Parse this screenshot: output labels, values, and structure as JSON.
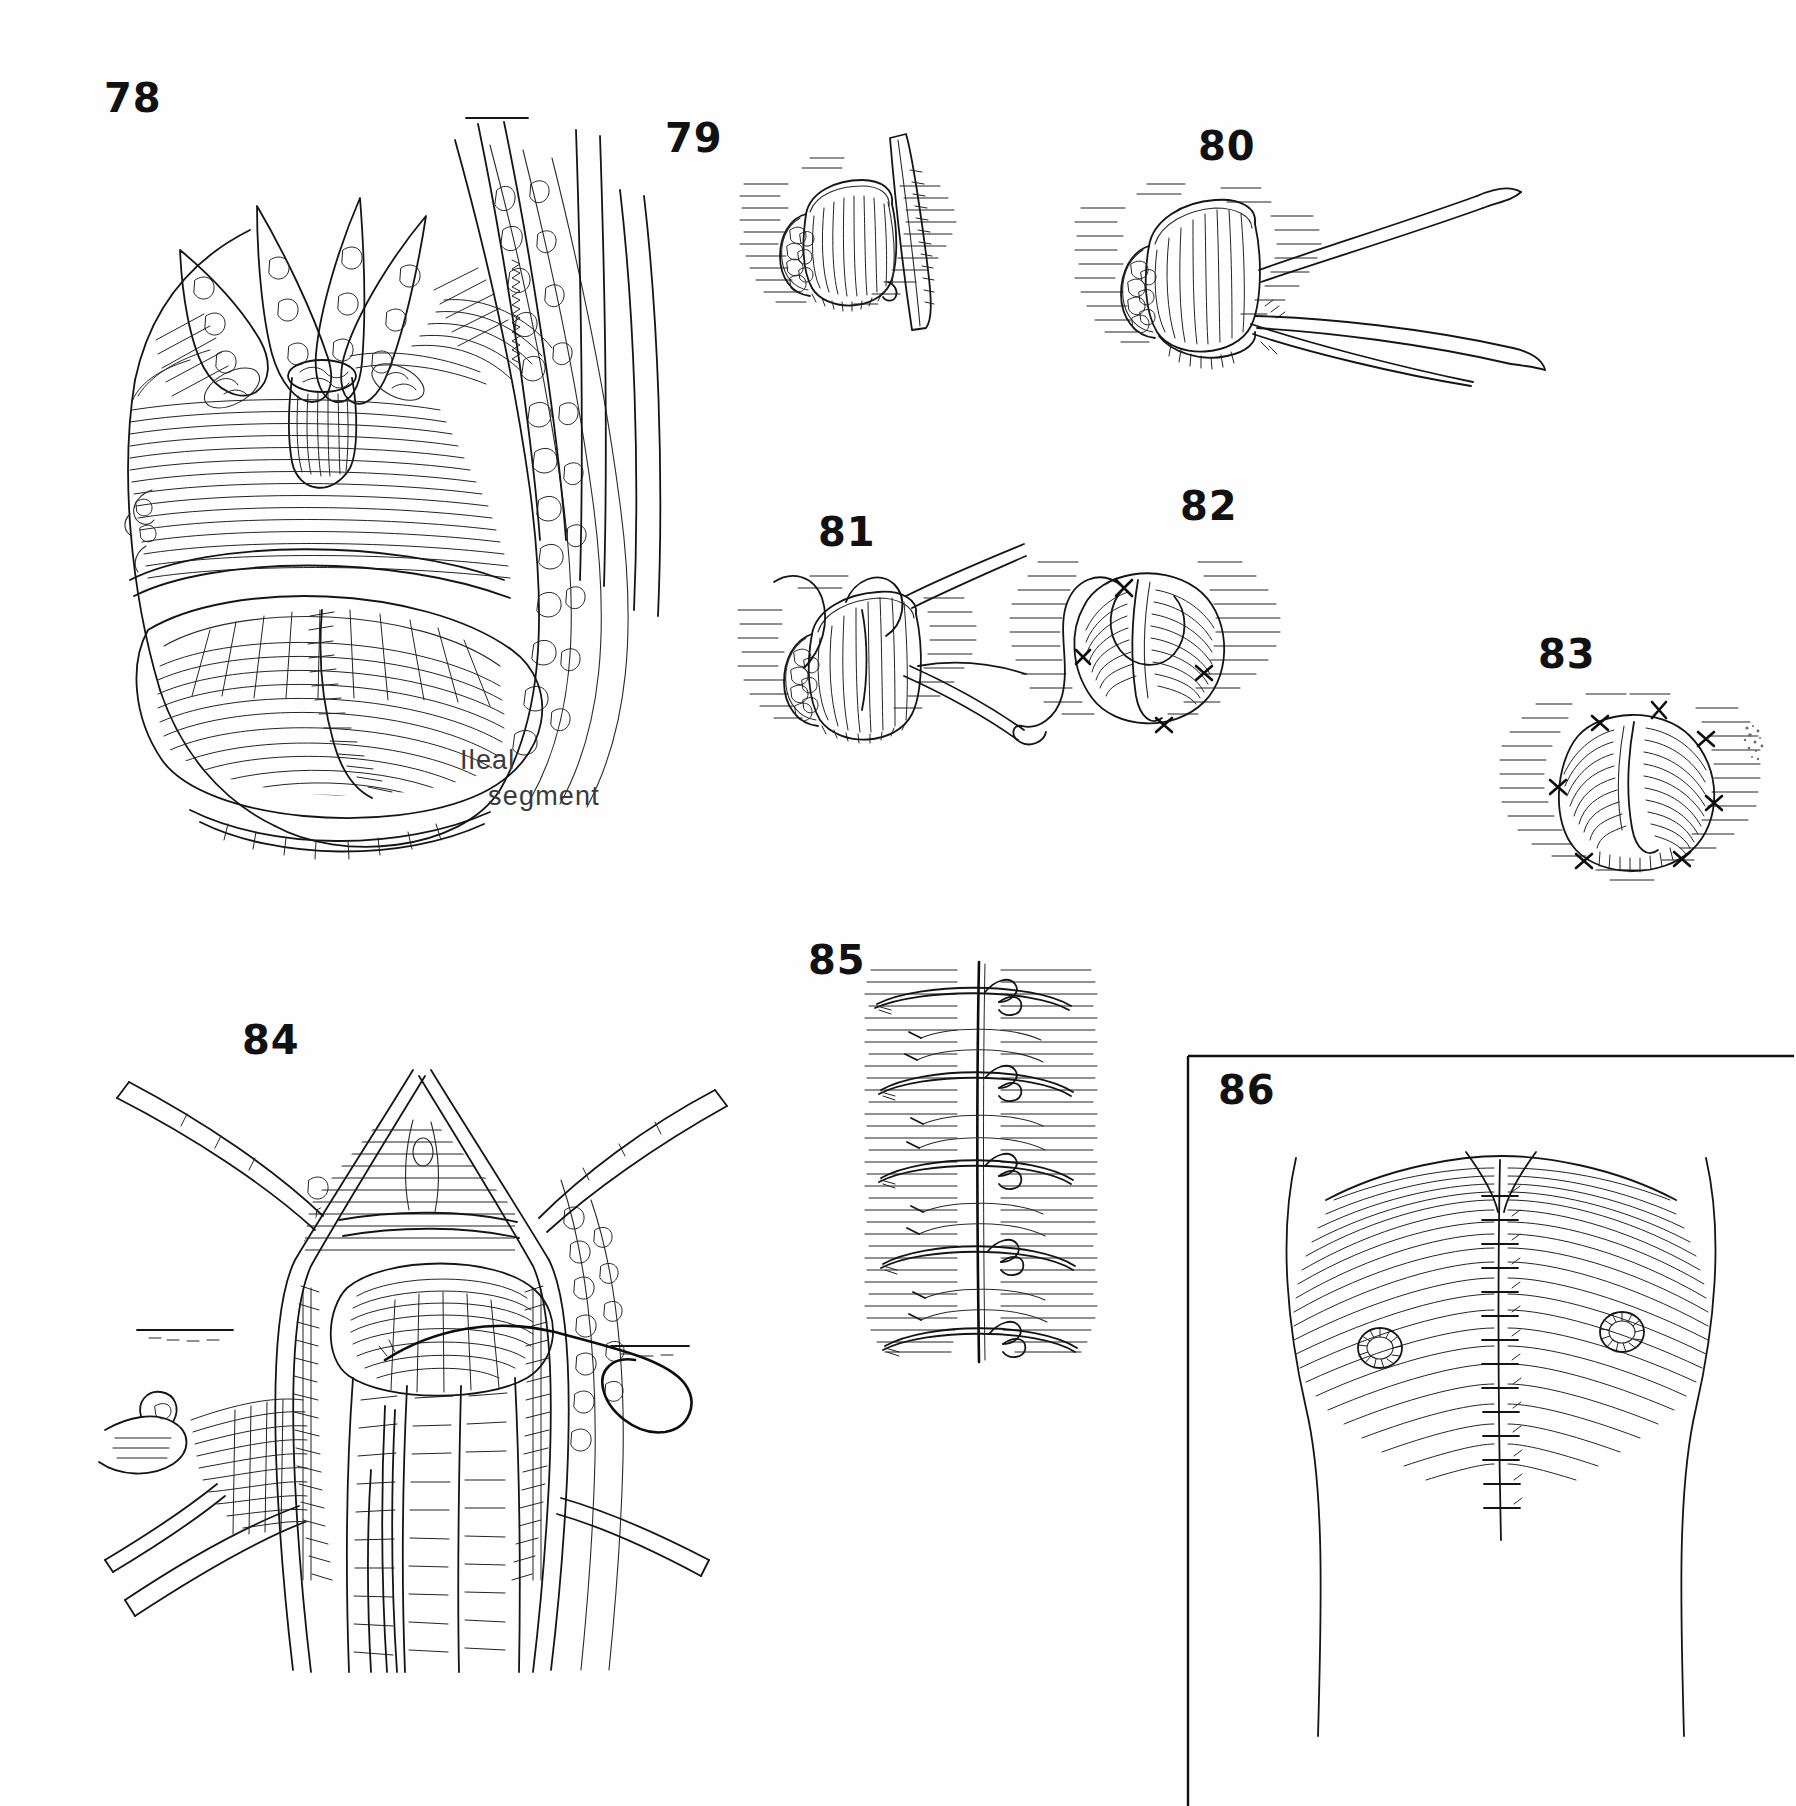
{
  "plate": {
    "background": "#ffffff",
    "ink_color": "#1b1b1b",
    "width": 1792,
    "height": 1806,
    "style": "pen-and-ink surgical atlas line drawing"
  },
  "figures": [
    {
      "id": "fig-78",
      "number": "78",
      "subject": "open abdominal surgical field with retracted bowel loops, sutured ileal segment and retractors",
      "caption_lines": [
        "Ileal",
        "segment"
      ],
      "has_caption": true
    },
    {
      "id": "fig-79",
      "number": "79",
      "subject": "bowel stoma stump being incised with a scalpel blade",
      "has_caption": false
    },
    {
      "id": "fig-80",
      "number": "80",
      "subject": "bowel stump held with forceps and scissors everting the edge",
      "has_caption": false
    },
    {
      "id": "fig-81",
      "number": "81",
      "subject": "stoma stump with suture passed through mucosa and needle holder",
      "has_caption": false
    },
    {
      "id": "fig-82",
      "number": "82",
      "subject": "everted stoma rosette being sutured, free suture tail trailing",
      "has_caption": false
    },
    {
      "id": "fig-83",
      "number": "83",
      "subject": "completed matured stoma rosette with radial interrupted sutures",
      "has_caption": false
    },
    {
      "id": "fig-84",
      "number": "84",
      "subject": "midline wound held with retractors, bowel delivered, suture loop around mesentery",
      "has_caption": false
    },
    {
      "id": "fig-85",
      "number": "85",
      "subject": "closed midline abdominal incision with tied retention sutures and interrupted stitches",
      "has_caption": false
    },
    {
      "id": "fig-86",
      "number": "86",
      "subject": "framed view of abdomen with closed midline suture line and two matured stomas",
      "framed": true,
      "has_caption": false
    }
  ],
  "labels": {
    "fig78_caption_line1": "Ileal",
    "fig78_caption_line2": "segment",
    "num78": "78",
    "num79": "79",
    "num80": "80",
    "num81": "81",
    "num82": "82",
    "num83": "83",
    "num84": "84",
    "num85": "85",
    "num86": "86"
  }
}
